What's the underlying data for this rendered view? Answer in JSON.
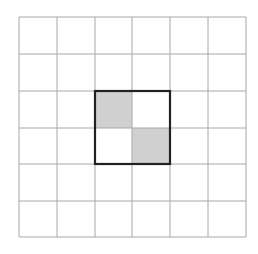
{
  "diagram": {
    "type": "grid",
    "rows": 6,
    "cols": 6,
    "x_lines": [
      19,
      57,
      95,
      132,
      170,
      208,
      246
    ],
    "y_lines": [
      17,
      54,
      91,
      128,
      164,
      201,
      237
    ],
    "grid_line_color": "#a8a8a8",
    "background_color": "#ffffff",
    "shaded_color": "#d0d0d0",
    "highlight_border_color": "#222222",
    "shaded_cells": [
      {
        "row": 2,
        "col": 2
      },
      {
        "row": 3,
        "col": 3
      }
    ],
    "highlight_region": {
      "row_start": 2,
      "col_start": 2,
      "row_end": 3,
      "col_end": 3
    }
  }
}
